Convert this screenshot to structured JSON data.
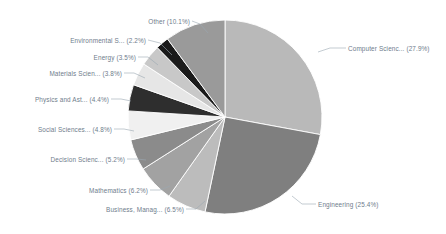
{
  "chart": {
    "type": "pie",
    "title": "",
    "background_color": "#ffffff",
    "label_color": "#6f7d8c",
    "leader_line_color": "#9aa7b2",
    "slice_border_color": "#ffffff"
  },
  "chart_data": {
    "type": "pie",
    "title": "",
    "subtitle": "",
    "xlabel": "",
    "ylabel": "",
    "legend_position": "none",
    "grid": false,
    "value_unit": "percent",
    "total": 100.0,
    "categories": [
      "Computer Scienc...",
      "Engineering",
      "Business, Manag...",
      "Mathematics",
      "Decision Scienc...",
      "Social Sciences...",
      "Physics and Ast...",
      "Materials Scien...",
      "Energy",
      "Environmental S...",
      "Other"
    ],
    "values": [
      27.9,
      25.4,
      6.5,
      6.2,
      5.2,
      4.8,
      4.4,
      3.8,
      3.5,
      2.2,
      10.1
    ],
    "colors": [
      "#b9b9b9",
      "#7f7f7f",
      "#bcbcbc",
      "#a2a2a2",
      "#8b8b8b",
      "#f0f0f0",
      "#2e2e2e",
      "#e6e6e6",
      "#c8c8c8",
      "#1a1a1a",
      "#9a9a9a"
    ],
    "slices": [
      {
        "label": "Computer Scienc...",
        "value": 27.9,
        "display": "Computer Scienc... (27.9%)",
        "color": "#b9b9b9"
      },
      {
        "label": "Engineering",
        "value": 25.4,
        "display": "Engineering (25.4%)",
        "color": "#7f7f7f"
      },
      {
        "label": "Business, Manag...",
        "value": 6.5,
        "display": "Business, Manag... (6.5%)",
        "color": "#bcbcbc"
      },
      {
        "label": "Mathematics",
        "value": 6.2,
        "display": "Mathematics (6.2%)",
        "color": "#a2a2a2"
      },
      {
        "label": "Decision Scienc...",
        "value": 5.2,
        "display": "Decision Scienc... (5.2%)",
        "color": "#8b8b8b"
      },
      {
        "label": "Social Sciences...",
        "value": 4.8,
        "display": "Social Sciences... (4.8%)",
        "color": "#f0f0f0"
      },
      {
        "label": "Physics and Ast...",
        "value": 4.4,
        "display": "Physics and Ast... (4.4%)",
        "color": "#2e2e2e"
      },
      {
        "label": "Materials Scien...",
        "value": 3.8,
        "display": "Materials Scien... (3.8%)",
        "color": "#e6e6e6"
      },
      {
        "label": "Energy",
        "value": 3.5,
        "display": "Energy (3.5%)",
        "color": "#c8c8c8"
      },
      {
        "label": "Environmental S...",
        "value": 2.2,
        "display": "Environmental S... (2.2%)",
        "color": "#1a1a1a"
      },
      {
        "label": "Other",
        "value": 10.1,
        "display": "Other (10.1%)",
        "color": "#9a9a9a"
      }
    ]
  },
  "labels": {
    "computer_science": "Computer Scienc... (27.9%)",
    "engineering": "Engineering (25.4%)",
    "business": "Business, Manag... (6.5%)",
    "mathematics": "Mathematics (6.2%)",
    "decision_sciences": "Decision Scienc... (5.2%)",
    "social_sciences": "Social Sciences... (4.8%)",
    "physics": "Physics and Ast... (4.4%)",
    "materials_science": "Materials Scien... (3.8%)",
    "energy": "Energy (3.5%)",
    "environmental_science": "Environmental S... (2.2%)",
    "other": "Other (10.1%)"
  }
}
